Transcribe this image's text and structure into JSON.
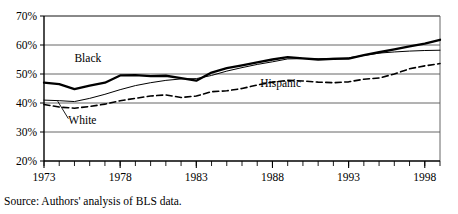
{
  "figure": {
    "source_note": "Source: Authors' analysis of BLS data."
  },
  "chart_data": {
    "type": "line",
    "title": "",
    "xlabel": "",
    "ylabel": "",
    "xlim": [
      1973,
      1999
    ],
    "ylim": [
      20,
      70
    ],
    "yticks": [
      20,
      30,
      40,
      50,
      60,
      70
    ],
    "ytick_labels": [
      "20%",
      "30%",
      "40%",
      "50%",
      "60%",
      "70%"
    ],
    "xticks": [
      1973,
      1978,
      1983,
      1988,
      1993,
      1998
    ],
    "xtick_labels": [
      "1973",
      "1978",
      "1983",
      "1988",
      "1993",
      "1998"
    ],
    "minor_xticks_every": 1,
    "grid": "horizontal",
    "legend": "inline-labels",
    "x": [
      1973,
      1974,
      1975,
      1976,
      1977,
      1978,
      1979,
      1980,
      1981,
      1982,
      1983,
      1984,
      1985,
      1986,
      1987,
      1988,
      1989,
      1990,
      1991,
      1992,
      1993,
      1994,
      1995,
      1996,
      1997,
      1998,
      1999
    ],
    "series": [
      {
        "name": "Black",
        "style": "thick-solid",
        "color": "#000000",
        "label_x": 1975.0,
        "label_y": 54.0,
        "values": [
          47.0,
          46.5,
          44.8,
          46.0,
          47.0,
          49.5,
          49.6,
          49.3,
          49.4,
          48.6,
          47.7,
          50.5,
          52.0,
          53.0,
          54.0,
          55.0,
          55.8,
          55.4,
          55.0,
          55.2,
          55.3,
          56.5,
          57.5,
          58.5,
          59.5,
          60.5,
          61.8
        ]
      },
      {
        "name": "White",
        "style": "thin-solid",
        "color": "#000000",
        "label_x": 1974.6,
        "label_y": 32.7,
        "leader_from": [
          1974.6,
          34.6
        ],
        "leader_to": [
          1973.9,
          40.6
        ],
        "values": [
          41.0,
          40.8,
          40.5,
          41.6,
          43.0,
          44.6,
          46.0,
          47.0,
          47.8,
          48.3,
          48.4,
          49.5,
          51.0,
          52.2,
          53.3,
          54.2,
          55.2,
          55.3,
          55.2,
          55.4,
          55.6,
          56.4,
          57.2,
          57.6,
          57.9,
          58.1,
          58.2
        ]
      },
      {
        "name": "Hispanic",
        "style": "dashed",
        "color": "#000000",
        "label_x": 1987.2,
        "label_y": 45.4,
        "values": [
          39.5,
          38.6,
          38.2,
          38.8,
          39.6,
          40.8,
          41.6,
          42.4,
          42.8,
          41.9,
          42.4,
          43.9,
          44.2,
          45.0,
          46.2,
          47.2,
          47.8,
          47.6,
          47.2,
          47.0,
          47.3,
          48.2,
          48.6,
          50.0,
          51.8,
          52.8,
          53.6
        ]
      }
    ]
  }
}
